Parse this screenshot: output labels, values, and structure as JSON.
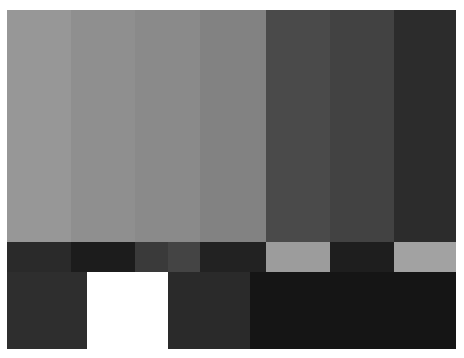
{
  "pattern": {
    "name": "Grayscale SMPTE-style test pattern",
    "top_bars": [
      {
        "width": 64,
        "color": "#979797"
      },
      {
        "width": 64,
        "color": "#8f8f8f"
      },
      {
        "width": 65,
        "color": "#8a8a8a"
      },
      {
        "width": 66,
        "color": "#828282"
      },
      {
        "width": 64,
        "color": "#4a4a4a"
      },
      {
        "width": 64,
        "color": "#424242"
      },
      {
        "width": 62,
        "color": "#2c2c2c"
      }
    ],
    "middle_strip": [
      {
        "width": 64,
        "color": "#2a2a2a"
      },
      {
        "width": 64,
        "color": "#1c1c1c"
      },
      {
        "width": 33,
        "color": "#3a3a3a"
      },
      {
        "width": 32,
        "color": "#444444"
      },
      {
        "width": 66,
        "color": "#222222"
      },
      {
        "width": 64,
        "color": "#9c9c9c"
      },
      {
        "width": 64,
        "color": "#1e1e1e"
      },
      {
        "width": 62,
        "color": "#a2a2a2"
      }
    ],
    "bottom_blocks": [
      {
        "width": 80,
        "color": "#2e2e2e"
      },
      {
        "width": 81,
        "color": "#ffffff"
      },
      {
        "width": 82,
        "color": "#2a2a2a"
      },
      {
        "width": 206,
        "color": "#151515"
      }
    ]
  }
}
